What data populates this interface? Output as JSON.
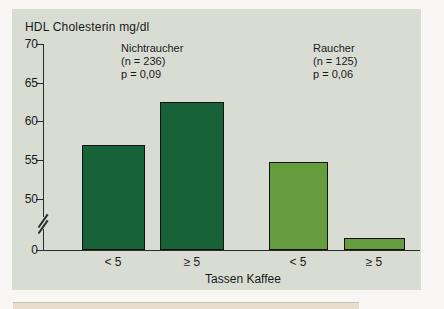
{
  "figure": {
    "title": "HDL Cholesterin mg/dl",
    "x_axis_label": "Tassen Kaffee",
    "y_tick_labels": [
      "70",
      "65",
      "60",
      "55",
      "50",
      "0"
    ],
    "x_category_labels": [
      "< 5",
      "≥ 5",
      "< 5",
      "≥ 5"
    ],
    "annotations": {
      "nonsmokers": {
        "line1": "Nichtraucher",
        "line2": "(n = 236)",
        "line3": "p = 0,09"
      },
      "smokers": {
        "line1": "Raucher",
        "line2": "(n = 125)",
        "line3": "p = 0,06"
      }
    },
    "colors": {
      "dark_green": "#176238",
      "light_green": "#659c3d",
      "panel_bg": "#d9dcd3",
      "outer_bg": "#f7f6f2",
      "axis": "#2b2b2b"
    }
  },
  "chart_data": {
    "type": "bar",
    "title": "HDL Cholesterin mg/dl",
    "xlabel": "Tassen Kaffee",
    "ylabel": "HDL Cholesterin mg/dl",
    "ylim": [
      0,
      70
    ],
    "y_ticks": [
      0,
      50,
      55,
      60,
      65,
      70
    ],
    "y_axis_break_between": [
      0,
      50
    ],
    "grid": false,
    "categories": [
      "< 5",
      "≥ 5"
    ],
    "series": [
      {
        "name": "Nichtraucher",
        "n": 236,
        "p": "p = 0,09",
        "color": "#176238",
        "values": [
          57,
          62.5
        ]
      },
      {
        "name": "Raucher",
        "n": 125,
        "p": "p = 0,06",
        "color": "#659c3d",
        "values": [
          54.8,
          45
        ],
        "note": "second bar is drawn below the y-axis break; its height is not to scale"
      }
    ]
  }
}
